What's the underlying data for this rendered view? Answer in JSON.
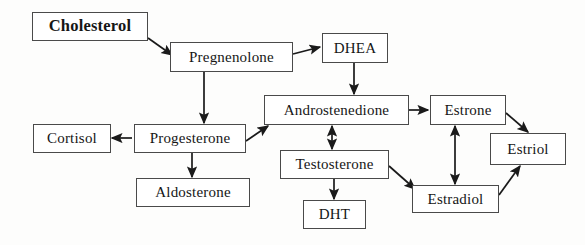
{
  "diagram": {
    "background_color": "#fdfdfc",
    "box_border_color": "#4a4a4a",
    "arrow_color": "#1a1a1a",
    "text_color": "#161616",
    "nodes": [
      {
        "id": "cholesterol",
        "label": "Cholesterol",
        "x": 32,
        "y": 12,
        "w": 116,
        "h": 29,
        "emphasis": true
      },
      {
        "id": "pregnenolone",
        "label": "Pregnenolone",
        "x": 170,
        "y": 42,
        "w": 123,
        "h": 30,
        "emphasis": false
      },
      {
        "id": "dhea",
        "label": "DHEA",
        "x": 322,
        "y": 33,
        "w": 66,
        "h": 30,
        "emphasis": false
      },
      {
        "id": "androstenedione",
        "label": "Androstenedione",
        "x": 264,
        "y": 95,
        "w": 145,
        "h": 30,
        "emphasis": false
      },
      {
        "id": "estrone",
        "label": "Estrone",
        "x": 430,
        "y": 95,
        "w": 76,
        "h": 30,
        "emphasis": false
      },
      {
        "id": "estriol",
        "label": "Estriol",
        "x": 490,
        "y": 133,
        "w": 76,
        "h": 32,
        "emphasis": false
      },
      {
        "id": "cortisol",
        "label": "Cortisol",
        "x": 33,
        "y": 124,
        "w": 78,
        "h": 29,
        "emphasis": false
      },
      {
        "id": "progesterone",
        "label": "Progesterone",
        "x": 134,
        "y": 124,
        "w": 112,
        "h": 29,
        "emphasis": false
      },
      {
        "id": "aldosterone",
        "label": "Aldosterone",
        "x": 136,
        "y": 178,
        "w": 114,
        "h": 29,
        "emphasis": false
      },
      {
        "id": "testosterone",
        "label": "Testosterone",
        "x": 280,
        "y": 150,
        "w": 109,
        "h": 29,
        "emphasis": false
      },
      {
        "id": "dht",
        "label": "DHT",
        "x": 303,
        "y": 200,
        "w": 63,
        "h": 29,
        "emphasis": false
      },
      {
        "id": "estradiol",
        "label": "Estradiol",
        "x": 412,
        "y": 185,
        "w": 87,
        "h": 28,
        "emphasis": false
      }
    ],
    "edges": [
      {
        "id": "cholesterol-to-pregnenolone",
        "from": "cholesterol",
        "to": "pregnenolone",
        "x1": 148,
        "y1": 38,
        "x2": 172,
        "y2": 55,
        "bidirectional": false
      },
      {
        "id": "pregnenolone-to-dhea",
        "from": "pregnenolone",
        "to": "dhea",
        "x1": 293,
        "y1": 54,
        "x2": 320,
        "y2": 47,
        "bidirectional": false
      },
      {
        "id": "pregnenolone-to-progesterone",
        "from": "pregnenolone",
        "to": "progesterone",
        "x1": 204,
        "y1": 72,
        "x2": 204,
        "y2": 123,
        "bidirectional": false
      },
      {
        "id": "dhea-to-androstenedione",
        "from": "dhea",
        "to": "androstenedione",
        "x1": 354,
        "y1": 63,
        "x2": 354,
        "y2": 94,
        "bidirectional": false
      },
      {
        "id": "progesterone-to-cortisol",
        "from": "progesterone",
        "to": "cortisol",
        "x1": 132,
        "y1": 138,
        "x2": 112,
        "y2": 138,
        "bidirectional": false
      },
      {
        "id": "progesterone-to-aldosterone",
        "from": "progesterone",
        "to": "aldosterone",
        "x1": 192,
        "y1": 153,
        "x2": 192,
        "y2": 177,
        "bidirectional": false
      },
      {
        "id": "progesterone-to-androstenedione",
        "from": "progesterone",
        "to": "androstenedione",
        "x1": 246,
        "y1": 141,
        "x2": 268,
        "y2": 126,
        "bidirectional": false
      },
      {
        "id": "androstenedione-to-estrone",
        "from": "androstenedione",
        "to": "estrone",
        "x1": 409,
        "y1": 110,
        "x2": 428,
        "y2": 110,
        "bidirectional": false
      },
      {
        "id": "androstenedione-testosterone",
        "from": "androstenedione",
        "to": "testosterone",
        "x1": 332,
        "y1": 126,
        "x2": 332,
        "y2": 149,
        "bidirectional": true
      },
      {
        "id": "testosterone-to-dht",
        "from": "testosterone",
        "to": "dht",
        "x1": 334,
        "y1": 179,
        "x2": 334,
        "y2": 199,
        "bidirectional": false
      },
      {
        "id": "testosterone-to-estradiol",
        "from": "testosterone",
        "to": "estradiol",
        "x1": 389,
        "y1": 166,
        "x2": 415,
        "y2": 189,
        "bidirectional": false
      },
      {
        "id": "estrone-estradiol",
        "from": "estrone",
        "to": "estradiol",
        "x1": 455,
        "y1": 126,
        "x2": 455,
        "y2": 184,
        "bidirectional": true
      },
      {
        "id": "estrone-to-estriol",
        "from": "estrone",
        "to": "estriol",
        "x1": 506,
        "y1": 113,
        "x2": 528,
        "y2": 132,
        "bidirectional": false
      },
      {
        "id": "estradiol-to-estriol",
        "from": "estradiol",
        "to": "estriol",
        "x1": 499,
        "y1": 195,
        "x2": 520,
        "y2": 166,
        "bidirectional": false
      }
    ]
  }
}
